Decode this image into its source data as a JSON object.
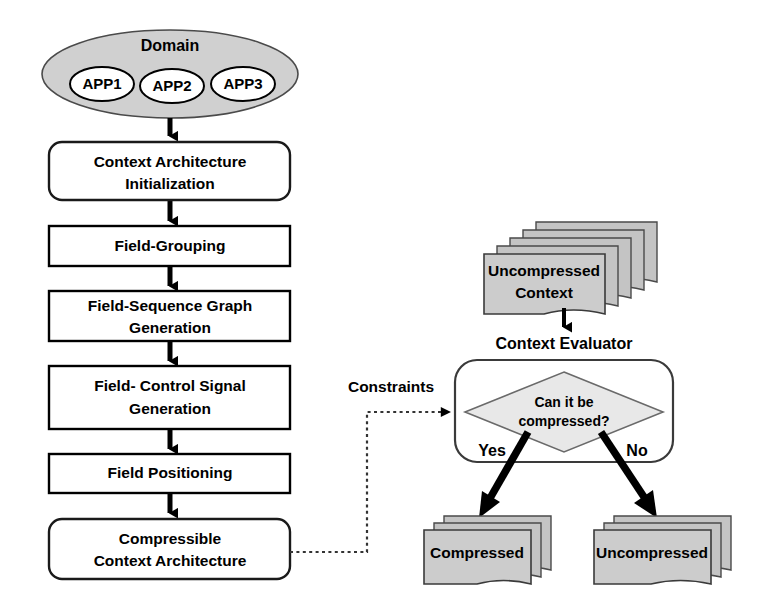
{
  "diagram": {
    "colors": {
      "domain_fill": "#d0d0d0",
      "document_fill": "#cccccc",
      "diamond_fill": "#e8e8e8",
      "line": "#000000",
      "background": "#ffffff"
    }
  },
  "domain": {
    "label": "Domain",
    "apps": [
      {
        "label": "APP1"
      },
      {
        "label": "APP2"
      },
      {
        "label": "APP3"
      }
    ]
  },
  "pipeline": {
    "steps": [
      {
        "id": "init",
        "line1": "Context Architecture",
        "line2": "Initialization",
        "shape": "rounded"
      },
      {
        "id": "grouping",
        "line1": "Field-Grouping",
        "line2": "",
        "shape": "rect"
      },
      {
        "id": "fsg",
        "line1": "Field-Sequence Graph",
        "line2": "Generation",
        "shape": "rect"
      },
      {
        "id": "fcs",
        "line1": "Field- Control Signal",
        "line2": "Generation",
        "shape": "rect"
      },
      {
        "id": "positioning",
        "line1": "Field Positioning",
        "line2": "",
        "shape": "rect"
      },
      {
        "id": "cca",
        "line1": "Compressible",
        "line2": "Context Architecture",
        "shape": "rounded"
      }
    ]
  },
  "constraints": {
    "label": "Constraints",
    "style": "dotted"
  },
  "evaluator": {
    "label": "Context Evaluator",
    "decision": {
      "line1": "Can it be",
      "line2": "compressed?"
    },
    "branches": [
      {
        "label": "Yes",
        "target": "compressed"
      },
      {
        "label": "No",
        "target": "uncompressed"
      }
    ]
  },
  "stacks": {
    "input": {
      "line1": "Uncompressed",
      "line2": "Context",
      "layers": 5
    },
    "yes_output": {
      "line1": "Compressed",
      "line2": "",
      "layers": 3
    },
    "no_output": {
      "line1": "Uncompressed",
      "line2": "",
      "layers": 3
    }
  }
}
